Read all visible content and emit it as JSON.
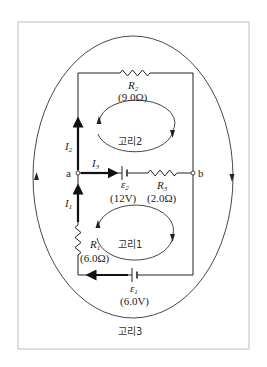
{
  "diagram": {
    "type": "circuit",
    "nodes": {
      "a": "a",
      "b": "b"
    },
    "currents": {
      "I1": {
        "symbol": "I",
        "sub": "1"
      },
      "I2": {
        "symbol": "I",
        "sub": "2"
      },
      "I3": {
        "symbol": "I",
        "sub": "3"
      }
    },
    "resistors": {
      "R1": {
        "symbol": "R",
        "sub": "1",
        "value": "(6.0Ω)"
      },
      "R2": {
        "symbol": "R",
        "sub": "2",
        "value": "(9.0Ω)"
      },
      "R3": {
        "symbol": "R",
        "sub": "3",
        "value": "(2.0Ω)"
      }
    },
    "batteries": {
      "E1": {
        "symbol": "ε",
        "sub": "1",
        "value": "(6.0V)"
      },
      "E2": {
        "symbol": "ε",
        "sub": "2",
        "value": "(12V)"
      }
    },
    "loops": {
      "loop1": "고리1",
      "loop2": "고리2",
      "loop3": "고리3"
    }
  }
}
